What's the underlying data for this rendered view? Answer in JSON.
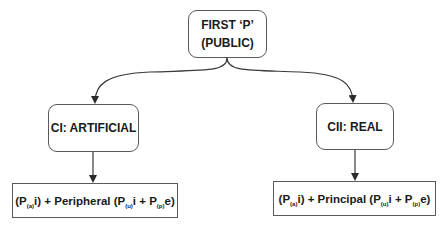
{
  "diagram": {
    "root": {
      "line1": "FIRST ‘P’",
      "line2": "(PUBLIC)"
    },
    "left": {
      "label": "CI: ARTIFICIAL",
      "formula": {
        "p1": "(P",
        "s1": "(a)",
        "t1": "i) + Peripheral (P",
        "s2": "(u)",
        "t2": "i + P",
        "s3": "(p)",
        "t3": "e)"
      }
    },
    "right": {
      "label": "CII: REAL",
      "formula": {
        "p1": "(P",
        "s1": "(a)",
        "t1": "i) + Principal (P",
        "s2": "(u)",
        "t2": "i + P",
        "s3": "(p)",
        "t3": "e)"
      }
    },
    "colors": {
      "stroke": "#5a5a5a",
      "arrow": "#2a2a2a",
      "text": "#1a1a1a"
    }
  }
}
